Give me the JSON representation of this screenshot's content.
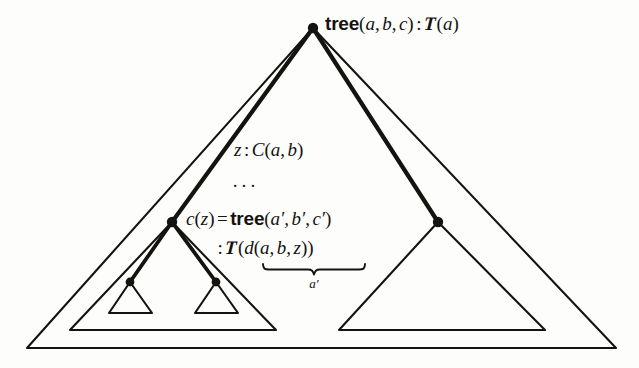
{
  "figure": {
    "kind": "tree-type-derivation-diagram",
    "background_color": "#fdfdfc",
    "ink_color": "#15130f",
    "width": 639,
    "height": 368
  },
  "labels": {
    "root": {
      "constructor": "tree",
      "open": "(",
      "arg1": "a",
      "comma1": ",",
      "arg2": "b",
      "comma2": ",",
      "arg3": "c",
      "close": ")",
      "colon": ":",
      "type_head": "T",
      "type_open": "(",
      "type_arg": "a",
      "type_close": ")",
      "plain": "tree(a, b, c) : T(a)"
    },
    "edge_z": {
      "var": "z",
      "colon": ":",
      "type_head": "C",
      "open": "(",
      "arg1": "a",
      "comma": ",",
      "arg2": "b",
      "close": ")",
      "plain": "z : C(a, b)"
    },
    "ellipsis": "···",
    "child": {
      "fn": "c",
      "fn_open": "(",
      "fn_arg": "z",
      "fn_close": ")",
      "equals": "=",
      "constructor": "tree",
      "open": "(",
      "arg1": "a",
      "prime1": "′",
      "comma1": ",",
      "arg2": "b",
      "prime2": "′",
      "comma2": ",",
      "arg3": "c",
      "prime3": "′",
      "close": ")",
      "plain": "c(z) = tree(a′, b′, c′)"
    },
    "child_type": {
      "colon": ":",
      "type_head": "T",
      "open": "(",
      "inner_head": "d",
      "inner_open": "(",
      "arg1": "a",
      "comma1": ",",
      "arg2": "b",
      "comma2": ",",
      "arg3": "z",
      "inner_close": ")",
      "close": ")",
      "plain": ": T(d(a, b, z))"
    },
    "underbrace_label": {
      "base": "a",
      "prime": "′",
      "plain": "a′"
    }
  },
  "geometry": {
    "outer_triangle": {
      "apex": [
        313,
        28
      ],
      "base_left": [
        27,
        348
      ],
      "base_right": [
        616,
        348
      ]
    },
    "left_subtree_triangle": {
      "apex": [
        172,
        222
      ],
      "base_left": [
        70,
        330
      ],
      "base_right": [
        276,
        330
      ]
    },
    "right_subtree_triangle": {
      "apex": [
        438,
        222
      ],
      "base_left": [
        339,
        330
      ],
      "base_right": [
        545,
        330
      ]
    },
    "small_triangle_1": {
      "apex": [
        130,
        282
      ],
      "base_left": [
        109,
        313
      ],
      "base_right": [
        152,
        313
      ]
    },
    "small_triangle_2": {
      "apex": [
        216,
        282
      ],
      "base_left": [
        195,
        313
      ],
      "base_right": [
        238,
        313
      ]
    },
    "nodes": [
      {
        "name": "root-node",
        "x": 313,
        "y": 28,
        "r": 5
      },
      {
        "name": "left-child-node",
        "x": 172,
        "y": 222,
        "r": 5
      },
      {
        "name": "right-child-node",
        "x": 438,
        "y": 222,
        "r": 5
      },
      {
        "name": "grandchild-node-1",
        "x": 130,
        "y": 282,
        "r": 4
      },
      {
        "name": "grandchild-node-2",
        "x": 216,
        "y": 282,
        "r": 4
      }
    ],
    "edges": [
      {
        "name": "root-to-left-child",
        "from": [
          313,
          28
        ],
        "to": [
          172,
          222
        ]
      },
      {
        "name": "root-to-right-child",
        "from": [
          313,
          28
        ],
        "to": [
          438,
          222
        ]
      },
      {
        "name": "left-child-to-grandchild-1",
        "from": [
          172,
          222
        ],
        "to": [
          130,
          282
        ]
      },
      {
        "name": "left-child-to-grandchild-2",
        "from": [
          172,
          222
        ],
        "to": [
          216,
          282
        ]
      }
    ]
  }
}
